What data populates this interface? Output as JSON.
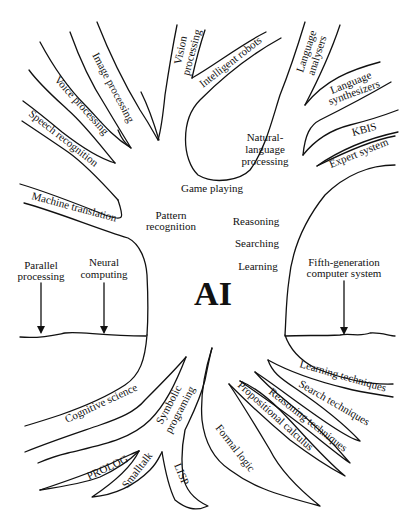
{
  "diagram": {
    "title": "AI",
    "type": "tree",
    "trunk_labels": [
      "Pattern recognition",
      "Game playing",
      "Reasoning",
      "Searching",
      "Learning"
    ],
    "branches": {
      "image_processing": "Image processing",
      "voice_processing": "Voice processing",
      "speech_recognition": "Speech recognition",
      "vision_processing_1": "Vision",
      "vision_processing_2": "processing",
      "intelligent_robots": "Intelligent robots",
      "language_analysers_1": "Language",
      "language_analysers_2": "analysers",
      "language_synthesizers_1": "Language",
      "language_synthesizers_2": "synthesizers",
      "nlp_1": "Natural-",
      "nlp_2": "language",
      "nlp_3": "processing",
      "kbis": "KBIS",
      "expert_system": "Expert system",
      "machine_translation": "Machine translation",
      "game_playing": "Game playing",
      "pattern_recognition_1": "Pattern",
      "pattern_recognition_2": "recognition",
      "reasoning": "Reasoning",
      "searching": "Searching",
      "learning": "Learning"
    },
    "ground": {
      "parallel_processing_1": "Parallel",
      "parallel_processing_2": "processing",
      "neural_computing_1": "Neural",
      "neural_computing_2": "computing",
      "fifth_gen_1": "Fifth-generation",
      "fifth_gen_2": "computer system"
    },
    "roots": {
      "cognitive_science": "Cognitive science",
      "symbolic_1": "Symbolic",
      "symbolic_2": "programing",
      "prolog": "PROLOG",
      "smalltalk": "Smalltalk",
      "lisp": "LISP",
      "formal_logic": "Formal logic",
      "propositional_calculus": "Propositional calculus",
      "reasoning_techniques": "Reasoning techniques",
      "search_techniques": "Search techniques",
      "learning_techniques": "Learning techniques"
    }
  }
}
